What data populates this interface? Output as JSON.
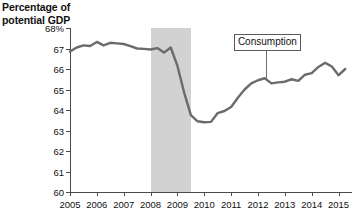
{
  "chart_data": {
    "type": "line",
    "title_line1": "Percentage of",
    "title_line2": "potential GDP",
    "xlabel": "",
    "ylabel": "Percentage of potential GDP",
    "xlim": [
      2005.0,
      2015.5
    ],
    "ylim": [
      60,
      68
    ],
    "grid": false,
    "legend_position": "inline-annotation",
    "y_ticks": [
      60,
      61,
      62,
      63,
      64,
      65,
      66,
      67,
      68
    ],
    "y_tick_labels": [
      "60",
      "61",
      "62",
      "63",
      "64",
      "65",
      "66",
      "67",
      "68%"
    ],
    "x_ticks": [
      2005,
      2006,
      2007,
      2008,
      2009,
      2010,
      2011,
      2012,
      2013,
      2014,
      2015
    ],
    "x_tick_labels": [
      "2005",
      "2006",
      "2007",
      "2008",
      "2009",
      "2010",
      "2011",
      "2012",
      "2013",
      "2014",
      "2015"
    ],
    "annotations": [
      {
        "text": "Consumption",
        "x": 2012.35,
        "y": 66.95,
        "points_to_x": 2012.35,
        "points_to_y": 65.45
      }
    ],
    "shaded_regions": [
      {
        "label": "recession",
        "x_start": 2008.0,
        "x_end": 2009.5,
        "color": "#d2d2d2"
      }
    ],
    "series": [
      {
        "name": "Consumption",
        "color": "#6b6b6b",
        "x": [
          2005.0,
          2005.25,
          2005.5,
          2005.75,
          2006.0,
          2006.25,
          2006.5,
          2006.75,
          2007.0,
          2007.25,
          2007.5,
          2007.75,
          2008.0,
          2008.25,
          2008.5,
          2008.75,
          2009.0,
          2009.25,
          2009.5,
          2009.75,
          2010.0,
          2010.25,
          2010.5,
          2010.75,
          2011.0,
          2011.25,
          2011.5,
          2011.75,
          2012.0,
          2012.25,
          2012.5,
          2012.75,
          2013.0,
          2013.25,
          2013.5,
          2013.75,
          2014.0,
          2014.25,
          2014.5,
          2014.75,
          2015.0,
          2015.25
        ],
        "values": [
          66.85,
          67.05,
          67.15,
          67.12,
          67.32,
          67.15,
          67.28,
          67.25,
          67.22,
          67.12,
          67.0,
          66.98,
          66.95,
          67.02,
          66.8,
          67.05,
          66.15,
          64.85,
          63.75,
          63.45,
          63.4,
          63.42,
          63.85,
          63.95,
          64.15,
          64.6,
          65.0,
          65.3,
          65.45,
          65.55,
          65.3,
          65.35,
          65.38,
          65.5,
          65.42,
          65.72,
          65.8,
          66.1,
          66.3,
          66.12,
          65.7,
          66.0
        ]
      }
    ]
  }
}
